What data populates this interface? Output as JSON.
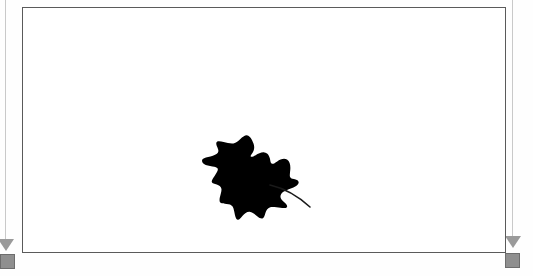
{
  "document": {
    "background_color": "#fefefe",
    "page": {
      "label": "Page canvas",
      "fill_color": "#ffffff",
      "border_color": "#5a5a5a",
      "border_width_px": 1,
      "x": 22,
      "y": 7,
      "width": 484,
      "height": 246
    }
  },
  "artwork": {
    "name": "leaf-silhouette",
    "description": "Black maple-like leaf silhouette with a curving stem extending to the lower right",
    "fill_color": "#000000",
    "stem_color": "#1a1a1a",
    "bounds": {
      "x": 180,
      "y": 130,
      "width": 160,
      "height": 100
    },
    "alt_text": "Black leaf silhouette"
  },
  "guides": {
    "left": {
      "name": "left-margin-guide",
      "color": "#c9c9c9",
      "x": 5,
      "top": 0,
      "height": 243
    },
    "right": {
      "name": "right-margin-guide",
      "color": "#c9c9c9",
      "x": 512,
      "top": 0,
      "height": 238
    }
  },
  "markers": {
    "arrow_color": "#9a9a9a",
    "left_arrow": {
      "name": "left-guide-arrow",
      "x": -2,
      "y": 239
    },
    "right_arrow": {
      "name": "right-guide-arrow",
      "x": 505,
      "y": 236
    }
  },
  "handles": {
    "fill_color": "#8f8f8f",
    "border_color": "#6d6d6d",
    "size_px": 15,
    "left_handle": {
      "name": "left-resize-handle",
      "x": 0,
      "y": 254
    },
    "right_handle": {
      "name": "right-resize-handle",
      "x": 505,
      "y": 253
    }
  }
}
